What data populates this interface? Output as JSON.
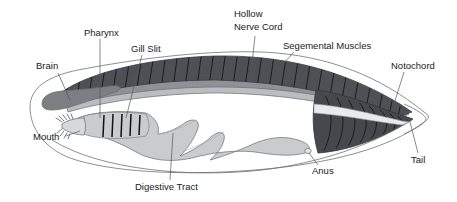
{
  "figure": {
    "background_color": "#ffffff",
    "width": 457,
    "height": 202
  },
  "palette": {
    "muscle_dark": "#4d5054",
    "muscle_dark_alt": "#45484c",
    "nerve_cord_gray": "#8e9195",
    "notochord_gray": "#b9bcc0",
    "brain_gray": "#7b7e82",
    "gut_light": "#c9cbcd",
    "body_white": "#ffffff",
    "outline_stroke": "#6e7176",
    "leader_stroke": "#55585c",
    "text_color": "#1a1a1a"
  },
  "labels": [
    {
      "id": "brain",
      "text": "Brain",
      "x": 36,
      "y": 66,
      "anchor": "start",
      "lines": [
        "Brain"
      ]
    },
    {
      "id": "pharynx",
      "text": "Pharynx",
      "x": 84,
      "y": 33,
      "anchor": "start",
      "lines": [
        "Pharynx"
      ]
    },
    {
      "id": "gill-slit",
      "text": "Gill Slit",
      "x": 131,
      "y": 49,
      "anchor": "start",
      "lines": [
        "Gill Slit"
      ]
    },
    {
      "id": "hollow-nerve-cord",
      "text": "Hollow Nerve Cord",
      "x": 234,
      "y": 14,
      "anchor": "start",
      "lines": [
        "Hollow",
        "Nerve Cord"
      ]
    },
    {
      "id": "segemental-muscles",
      "text": "Segemental Muscles",
      "x": 283,
      "y": 46,
      "anchor": "start",
      "lines": [
        "Segemental Muscles"
      ]
    },
    {
      "id": "notochord",
      "text": "Notochord",
      "x": 391,
      "y": 66,
      "anchor": "start",
      "lines": [
        "Notochord"
      ]
    },
    {
      "id": "mouth",
      "text": "Mouth",
      "x": 33,
      "y": 137,
      "anchor": "start",
      "lines": [
        "Mouth"
      ]
    },
    {
      "id": "digestive-tract",
      "text": "Digestive Tract",
      "x": 135,
      "y": 187,
      "anchor": "start",
      "lines": [
        "Digestive Tract"
      ]
    },
    {
      "id": "anus",
      "text": "Anus",
      "x": 312,
      "y": 171,
      "anchor": "start",
      "lines": [
        "Anus"
      ]
    },
    {
      "id": "tail",
      "text": "Tail",
      "x": 411,
      "y": 160,
      "anchor": "start",
      "lines": [
        "Tail"
      ]
    }
  ],
  "leader_lines": [
    {
      "id": "brain-leader",
      "for": "brain",
      "path": "M 58 73 L 70 100"
    },
    {
      "id": "pharynx-leader",
      "for": "pharynx",
      "path": "M 100 39 L 100 118"
    },
    {
      "id": "gill-slit-leader",
      "for": "gill-slit",
      "path": "M 142 55 L 125 118"
    },
    {
      "id": "nerve-cord-leader",
      "for": "hollow-nerve-cord",
      "path": "M 255 36 L 250 83"
    },
    {
      "id": "segemental-muscles-leader",
      "for": "segemental-muscles",
      "path": "M 292 52 L 285 62"
    },
    {
      "id": "notochord-leader",
      "for": "notochord",
      "path": "M 404 72 L 395 104"
    },
    {
      "id": "mouth-leader",
      "for": "mouth",
      "path": "M 64 136 L 80 131"
    },
    {
      "id": "digestive-tract-leader",
      "for": "digestive-tract",
      "path": "M 170 180 L 172 132"
    },
    {
      "id": "anus-leader",
      "for": "anus",
      "path": "M 318 165 L 308 146"
    },
    {
      "id": "tail-leader",
      "for": "tail",
      "path": "M 418 153 L 410 117"
    }
  ],
  "anatomy": {
    "segment_count_dorsal": 30,
    "gill_slit_count": 5,
    "mouth_cirri_count": 9,
    "structures": [
      "body-outline",
      "segmental-muscles-band",
      "hollow-nerve-cord",
      "notochord",
      "brain",
      "pharynx",
      "gill-slits",
      "digestive-tract",
      "anus",
      "mouth",
      "tail-fin"
    ]
  }
}
